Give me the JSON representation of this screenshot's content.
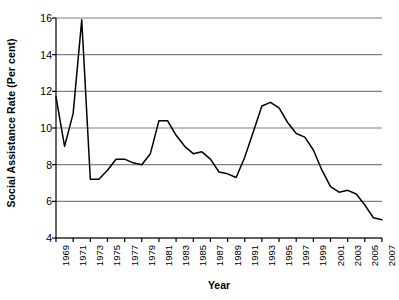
{
  "chart_data": {
    "type": "line",
    "title": "",
    "xlabel": "Year",
    "ylabel": "Social Assistance Rate (Per cent)",
    "xlim": [
      1969,
      2007
    ],
    "ylim": [
      4,
      16
    ],
    "yticks": [
      4,
      6,
      8,
      10,
      12,
      14,
      16
    ],
    "ytick_labels": [
      "4",
      "6",
      "8",
      "10",
      "12",
      "14",
      "16"
    ],
    "xticks": [
      1969,
      1971,
      1973,
      1975,
      1977,
      1979,
      1981,
      1983,
      1985,
      1987,
      1989,
      1991,
      1993,
      1995,
      1997,
      1999,
      2001,
      2003,
      2005,
      2007
    ],
    "xtick_labels": [
      "1969",
      "1971",
      "1973",
      "1975",
      "1977",
      "1979",
      "1981",
      "1983",
      "1985",
      "1987",
      "1989",
      "1991",
      "1993",
      "1995",
      "1997",
      "1999",
      "2001",
      "2003",
      "2005",
      "2007"
    ],
    "grid": "horizontal",
    "legend": "none",
    "line_color": "#000000",
    "grid_color": "#808080",
    "axis_color": "#000000",
    "x": [
      1969,
      1970,
      1971,
      1972,
      1973,
      1974,
      1975,
      1976,
      1977,
      1978,
      1979,
      1980,
      1981,
      1982,
      1983,
      1984,
      1985,
      1986,
      1987,
      1988,
      1989,
      1990,
      1991,
      1992,
      1993,
      1994,
      1995,
      1996,
      1997,
      1998,
      1999,
      2000,
      2001,
      2002,
      2003,
      2004,
      2005,
      2006,
      2007
    ],
    "values": [
      11.7,
      9.0,
      10.8,
      15.9,
      7.2,
      7.2,
      7.7,
      8.3,
      8.3,
      8.1,
      8.0,
      8.6,
      10.4,
      10.4,
      9.6,
      9.0,
      8.6,
      8.7,
      8.3,
      7.6,
      7.5,
      7.3,
      8.4,
      9.8,
      11.2,
      11.4,
      11.1,
      10.3,
      9.7,
      9.5,
      8.8,
      7.7,
      6.8,
      6.5,
      6.6,
      6.4,
      5.8,
      5.1,
      5.0
    ]
  }
}
